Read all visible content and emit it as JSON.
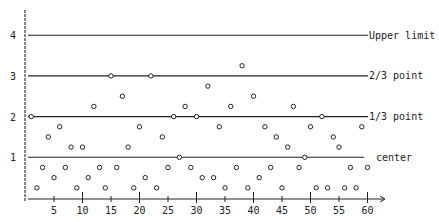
{
  "chart_data": {
    "type": "scatter",
    "title": "",
    "xlabel": "",
    "ylabel": "",
    "xlim": [
      0,
      60
    ],
    "ylim": [
      0,
      4
    ],
    "x_ticks": [
      5,
      10,
      15,
      20,
      25,
      30,
      35,
      40,
      45,
      50,
      55,
      60
    ],
    "x_tick_labels": [
      "5",
      "10",
      "15",
      "20",
      "25",
      "30",
      "35",
      "40",
      "45",
      "50",
      "55",
      "60"
    ],
    "y_ticks": [
      1,
      2,
      3,
      4
    ],
    "y_tick_labels": [
      "1",
      "2",
      "3",
      "4"
    ],
    "grid": false,
    "reference_lines": [
      {
        "y": 4,
        "label": "Upper limit"
      },
      {
        "y": 3,
        "label": "2/3 point"
      },
      {
        "y": 2,
        "label": "1/3 point"
      },
      {
        "y": 1,
        "label": "center"
      }
    ],
    "series": [
      {
        "name": "observations",
        "marker": "open-circle",
        "x": [
          1,
          2,
          3,
          4,
          5,
          6,
          7,
          8,
          9,
          10,
          11,
          12,
          13,
          14,
          15,
          16,
          17,
          18,
          19,
          20,
          21,
          22,
          23,
          24,
          25,
          26,
          27,
          28,
          29,
          30,
          31,
          32,
          33,
          34,
          35,
          36,
          37,
          38,
          39,
          40,
          41,
          42,
          43,
          44,
          45,
          46,
          47,
          48,
          49,
          50,
          51,
          52,
          53,
          54,
          55,
          56,
          57,
          58,
          59,
          60
        ],
        "values": [
          2.0,
          0.25,
          0.75,
          1.5,
          0.5,
          1.75,
          0.75,
          1.25,
          0.25,
          1.25,
          0.5,
          2.25,
          0.75,
          0.25,
          3.0,
          0.75,
          2.5,
          1.25,
          0.25,
          1.75,
          0.5,
          3.0,
          0.25,
          1.5,
          0.75,
          2.0,
          1.0,
          2.25,
          0.75,
          2.0,
          0.5,
          2.75,
          0.5,
          1.75,
          0.25,
          2.25,
          0.75,
          3.25,
          0.25,
          2.5,
          0.5,
          1.75,
          0.75,
          1.5,
          0.25,
          1.25,
          2.25,
          0.75,
          1.0,
          1.75,
          0.25,
          2.0,
          0.25,
          1.5,
          1.25,
          0.25,
          0.75,
          0.25,
          1.75,
          0.75
        ]
      }
    ],
    "colors": {
      "ink": "#222222",
      "background": "#ffffff"
    }
  }
}
